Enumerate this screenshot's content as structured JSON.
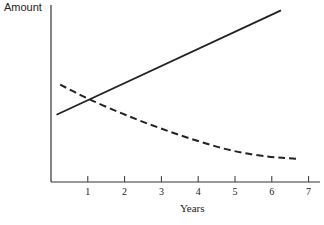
{
  "chart_data": {
    "type": "line",
    "title": "",
    "xlabel": "Years",
    "ylabel": "Amount",
    "x_ticks": [
      "1",
      "2",
      "3",
      "4",
      "5",
      "6",
      "7"
    ],
    "xlim": [
      0,
      7.3
    ],
    "grid": false,
    "legend": null,
    "series": [
      {
        "name": "increasing (solid)",
        "style": "solid",
        "x": [
          0.15,
          6.25
        ],
        "y": [
          0.38,
          0.97
        ]
      },
      {
        "name": "decreasing (dashed)",
        "style": "dashed",
        "x": [
          0.25,
          1,
          2,
          3,
          4,
          5,
          6,
          6.75
        ],
        "y": [
          0.55,
          0.47,
          0.38,
          0.3,
          0.23,
          0.17,
          0.14,
          0.13
        ]
      }
    ],
    "annotations": []
  },
  "axes": {
    "ylabel": "Amount",
    "xlabel": "Years",
    "ticks": [
      "1",
      "2",
      "3",
      "4",
      "5",
      "6",
      "7"
    ]
  },
  "colors": {
    "line": "#222222",
    "background": "#ffffff"
  }
}
